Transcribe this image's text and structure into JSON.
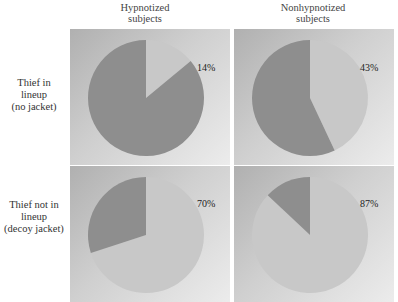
{
  "columns": [
    "Hypnotized subjects",
    "Nonhypnotized subjects"
  ],
  "column_lines": [
    [
      "Hypnotized",
      "subjects"
    ],
    [
      "Nonhypnotized",
      "subjects"
    ]
  ],
  "rows": [
    "Thief in lineup (no jacket)",
    "Thief not in lineup (decoy jacket)"
  ],
  "row_lines": [
    [
      "Thief in",
      "lineup",
      "(no jacket)"
    ],
    [
      "Thief not in",
      "lineup",
      "(decoy jacket)"
    ]
  ],
  "panels": [
    {
      "row": 0,
      "col": 0,
      "label": "14%",
      "value": 14
    },
    {
      "row": 0,
      "col": 1,
      "label": "43%",
      "value": 43
    },
    {
      "row": 1,
      "col": 0,
      "label": "70%",
      "value": 70
    },
    {
      "row": 1,
      "col": 1,
      "label": "87%",
      "value": 87
    }
  ],
  "colors": {
    "light_slice": "#c8c8c8",
    "dark_slice": "#8e8e8e"
  },
  "chart_data": {
    "type": "pie",
    "title": "",
    "layout": "2x2 grid of pie charts",
    "columns": [
      "Hypnotized subjects",
      "Nonhypnotized subjects"
    ],
    "rows": [
      "Thief in lineup (no jacket)",
      "Thief not in lineup (decoy jacket)"
    ],
    "series": [
      {
        "name": "Hypnotized subjects / Thief in lineup (no jacket)",
        "highlighted_percent": 14,
        "remainder_percent": 86
      },
      {
        "name": "Nonhypnotized subjects / Thief in lineup (no jacket)",
        "highlighted_percent": 43,
        "remainder_percent": 57
      },
      {
        "name": "Hypnotized subjects / Thief not in lineup (decoy jacket)",
        "highlighted_percent": 70,
        "remainder_percent": 30
      },
      {
        "name": "Nonhypnotized subjects / Thief not in lineup (decoy jacket)",
        "highlighted_percent": 87,
        "remainder_percent": 13
      }
    ],
    "annotations": [
      "14%",
      "43%",
      "70%",
      "87%"
    ],
    "legend": null,
    "grid": false
  }
}
